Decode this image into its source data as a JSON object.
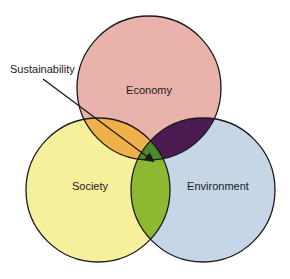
{
  "diagram": {
    "type": "venn",
    "circles": [
      {
        "id": "economy",
        "label": "Economy",
        "color": "#e9b2ab",
        "cx": 149,
        "cy": 88,
        "r": 72
      },
      {
        "id": "society",
        "label": "Society",
        "color": "#f6f09c",
        "cx": 98,
        "cy": 190,
        "r": 72
      },
      {
        "id": "environment",
        "label": "Environment",
        "color": "#c6d6e6",
        "cx": 203,
        "cy": 190,
        "r": 72
      }
    ],
    "intersections": {
      "economy_society": {
        "color": "#f0b04a"
      },
      "economy_environment": {
        "color": "#4b1b52"
      },
      "society_environment": {
        "color": "#8cb832"
      },
      "all_three": {
        "color": "#4b8a2a",
        "label": "Sustainability"
      }
    },
    "callout": {
      "label": "Sustainability",
      "arrow_from": [
        43,
        79
      ],
      "arrow_to": [
        155,
        163
      ]
    },
    "stroke_color": "#1a1a1a"
  }
}
